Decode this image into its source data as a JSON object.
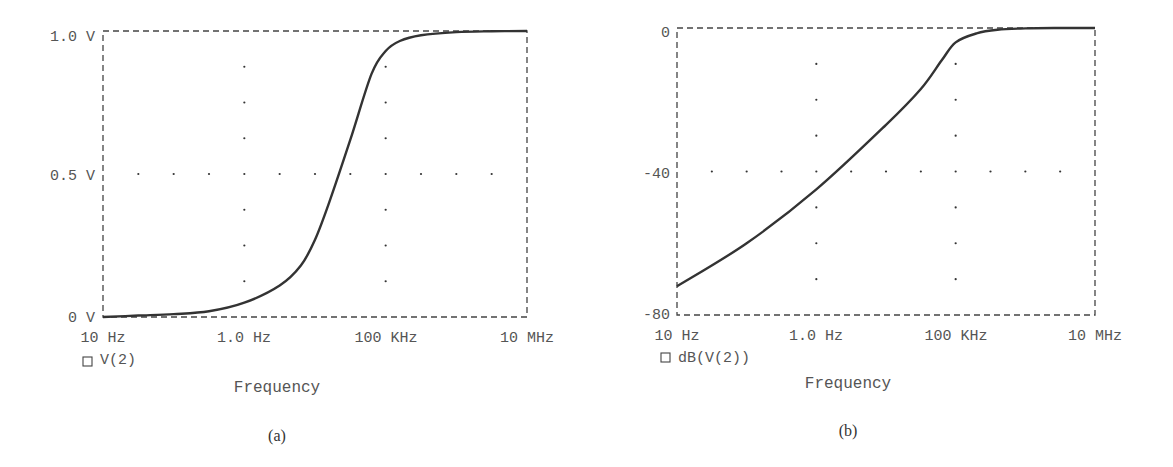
{
  "chart_data": [
    {
      "type": "line",
      "panel_label": "(a)",
      "title": "",
      "xlabel": "Frequency",
      "ylabel": "",
      "xscale": "log",
      "x_tick_labels": [
        "10 Hz",
        "1.0 Hz",
        "100 KHz",
        "10 MHz"
      ],
      "y_tick_labels": [
        "1.0 V",
        "0.5 V",
        "0 V"
      ],
      "ylim": [
        0,
        1.0
      ],
      "grid": "dotted cross at mid values",
      "legend": [
        "V(2)"
      ],
      "series": [
        {
          "name": "V(2)",
          "x_decades": [
            1,
            1.5,
            2,
            2.5,
            3,
            3.5,
            3.8,
            4,
            4.2,
            4.5,
            4.8,
            5,
            5.2,
            5.5,
            6,
            6.5,
            7
          ],
          "values": [
            0.0,
            0.005,
            0.01,
            0.02,
            0.05,
            0.11,
            0.18,
            0.27,
            0.4,
            0.62,
            0.85,
            0.93,
            0.965,
            0.985,
            0.996,
            0.999,
            1.0
          ]
        }
      ]
    },
    {
      "type": "line",
      "panel_label": "(b)",
      "title": "",
      "xlabel": "Frequency",
      "ylabel": "",
      "xscale": "log",
      "x_tick_labels": [
        "10 Hz",
        "1.0 Hz",
        "100 KHz",
        "10 MHz"
      ],
      "y_tick_labels": [
        "0",
        "-40",
        "-80"
      ],
      "ylim": [
        -80,
        0
      ],
      "grid": "dotted cross at mid values",
      "legend": [
        "dB(V(2))"
      ],
      "series": [
        {
          "name": "dB(V(2))",
          "x_decades": [
            1,
            2,
            3,
            4,
            4.5,
            4.8,
            5,
            5.3,
            5.6,
            6,
            6.5,
            7
          ],
          "values": [
            -72,
            -60,
            -45,
            -27,
            -17,
            -9,
            -4,
            -1.5,
            -0.5,
            -0.1,
            0,
            0
          ]
        }
      ]
    }
  ],
  "panels": [
    {
      "y_ticks": [
        "1.0 V",
        "0.5 V",
        "0 V"
      ],
      "x_ticks": [
        "10 Hz",
        "1.0 Hz",
        "100 KHz",
        "10 MHz"
      ],
      "legend_label": "V(2)",
      "xlabel": "Frequency",
      "caption": "(a)"
    },
    {
      "y_ticks": [
        "0",
        "-40",
        "-80"
      ],
      "x_ticks": [
        "10 Hz",
        "1.0 Hz",
        "100 KHz",
        "10 MHz"
      ],
      "legend_label": "dB(V(2))",
      "xlabel": "Frequency",
      "caption": "(b)"
    }
  ],
  "colors": {
    "curve": "#333333",
    "frame": "#444444",
    "text": "#555555"
  }
}
